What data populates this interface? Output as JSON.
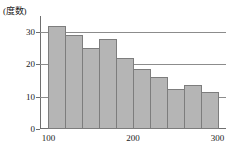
{
  "chart_data": {
    "type": "bar",
    "title": "",
    "subtitle": "",
    "ylabel": "(度数)",
    "xlabel": "",
    "xunit": "(g)",
    "ylim": [
      0,
      35
    ],
    "xlim": [
      90,
      310
    ],
    "grid": true,
    "legend": null,
    "bin_width": 20,
    "categories": [
      "100-120",
      "120-140",
      "140-160",
      "160-180",
      "180-200",
      "200-220",
      "220-240",
      "240-260",
      "260-280",
      "280-300"
    ],
    "bin_edges": [
      100,
      120,
      140,
      160,
      180,
      200,
      220,
      240,
      260,
      280,
      300
    ],
    "values": [
      32,
      29,
      25,
      28,
      22,
      18.5,
      16,
      12.5,
      13.5,
      11.5
    ],
    "y_ticks": [
      0,
      10,
      20,
      30
    ],
    "y_tick_labels": [
      "0",
      "10",
      "20",
      "30"
    ],
    "x_ticks": [
      100,
      200,
      300
    ],
    "x_tick_labels": [
      "100",
      "200",
      "300"
    ],
    "gridline_values": [
      10,
      20,
      30
    ],
    "colors": {
      "bar_fill": "#b5b5b5",
      "bar_border": "#7d7d7d",
      "axis": "#6f6f6f",
      "grid": "#8c8c8c",
      "text": "#1a1a1a",
      "background": "#ffffff"
    }
  }
}
